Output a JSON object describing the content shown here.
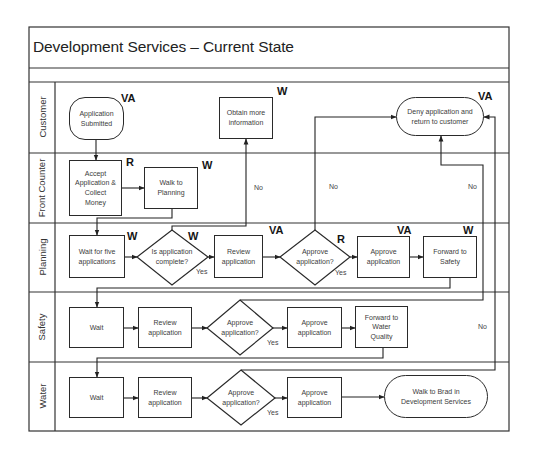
{
  "title": "Development Services – Current State",
  "lanes": [
    {
      "label": "Customer"
    },
    {
      "label": "Front Counter"
    },
    {
      "label": "Planning"
    },
    {
      "label": "Safety"
    },
    {
      "label": "Water"
    }
  ],
  "nodes": {
    "application_submitted": {
      "lines": [
        "Application",
        "Submitted"
      ],
      "tag": "VA"
    },
    "obtain_more_information": {
      "lines": [
        "Obtain more",
        "information"
      ],
      "tag": "W"
    },
    "deny_application": {
      "lines": [
        "Deny application and",
        "return to customer"
      ],
      "tag": "VA"
    },
    "accept_application": {
      "lines": [
        "Accept",
        "Application &",
        "Collect",
        "Money"
      ],
      "tag": "R"
    },
    "walk_to_planning": {
      "lines": [
        "Walk to",
        "Planning"
      ],
      "tag": "W"
    },
    "wait_for_five": {
      "lines": [
        "Wait for five",
        "applications"
      ],
      "tag": "W"
    },
    "is_application_complete": {
      "lines": [
        "Is application",
        "complete?"
      ],
      "tag": "W"
    },
    "planning_review": {
      "lines": [
        "Review",
        "application"
      ],
      "tag": "VA"
    },
    "planning_approve_decision": {
      "lines": [
        "Approve",
        "application?"
      ],
      "tag": "R"
    },
    "planning_approve": {
      "lines": [
        "Approve",
        "application"
      ],
      "tag": "VA"
    },
    "forward_to_safety": {
      "lines": [
        "Forward to",
        "Safety"
      ],
      "tag": "W"
    },
    "safety_wait": {
      "lines": [
        "Wait"
      ]
    },
    "safety_review": {
      "lines": [
        "Review",
        "application"
      ]
    },
    "safety_approve_decision": {
      "lines": [
        "Approve",
        "application?"
      ]
    },
    "safety_approve": {
      "lines": [
        "Approve",
        "application"
      ]
    },
    "forward_to_water": {
      "lines": [
        "Forward to",
        "Water",
        "Quality"
      ]
    },
    "water_wait": {
      "lines": [
        "Wait"
      ]
    },
    "water_review": {
      "lines": [
        "Review",
        "application"
      ]
    },
    "water_approve_decision": {
      "lines": [
        "Approve",
        "application?"
      ]
    },
    "water_approve": {
      "lines": [
        "Approve",
        "application"
      ]
    },
    "walk_to_brad": {
      "lines": [
        "Walk to Brad in",
        "Development Services"
      ]
    }
  },
  "edge_labels": [
    {
      "text": "No"
    },
    {
      "text": "No"
    },
    {
      "text": "No"
    },
    {
      "text": "No"
    },
    {
      "text": "Yes"
    },
    {
      "text": "Yes"
    },
    {
      "text": "Yes"
    },
    {
      "text": "Yes"
    }
  ],
  "colors": {
    "line": "#2a2a2a",
    "text": "#3c3c3c",
    "background": "#ffffff"
  }
}
